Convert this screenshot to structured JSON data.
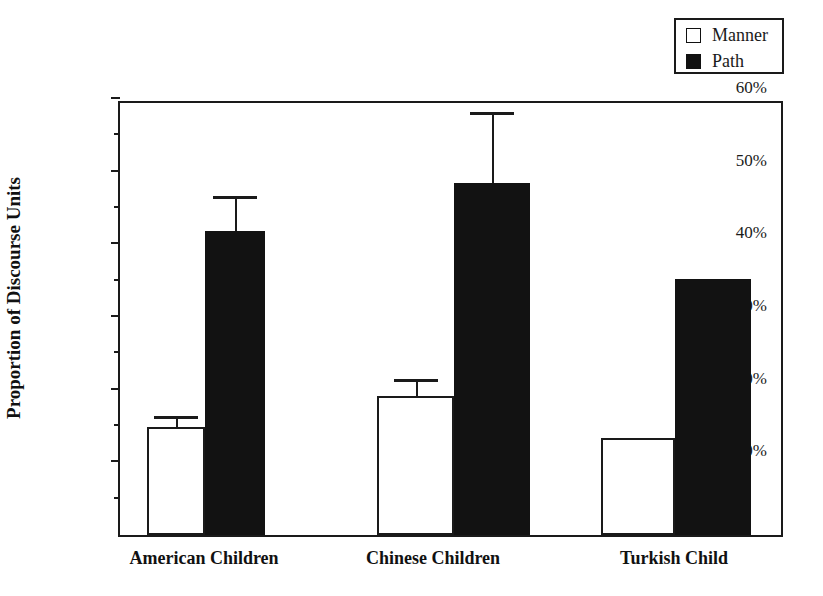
{
  "legend": {
    "position": "top-right",
    "entries": [
      {
        "label": "Manner",
        "swatch": "hollow-square-icon",
        "color": "#ffffff"
      },
      {
        "label": "Path",
        "swatch": "filled-square-icon",
        "color": "#121212"
      }
    ]
  },
  "axes": {
    "ylabel": "Proportion of Discourse Units",
    "ytick_labels": [
      "60%",
      "50%",
      "40%",
      "30%",
      "20%",
      "10%"
    ],
    "ytick_values": [
      60,
      50,
      40,
      30,
      20,
      10
    ],
    "yminor_values": [
      55,
      45,
      35,
      25,
      15,
      5
    ],
    "ylim": [
      0,
      60
    ],
    "xlabel": ""
  },
  "chart_data": {
    "type": "bar",
    "title": "",
    "xlabel": "",
    "ylabel": "Proportion of Discourse Units",
    "ylim": [
      0,
      60
    ],
    "ytick_labels": [
      "10%",
      "20%",
      "30%",
      "40%",
      "50%",
      "60%"
    ],
    "grid": false,
    "legend_position": "top-right",
    "units": "percent",
    "categories": [
      "American Children",
      "Chinese Children",
      "Turkish Child"
    ],
    "series": [
      {
        "name": "Manner",
        "fill": "#ffffff",
        "values": [
          14.8,
          19.1,
          13.3
        ],
        "errors_upper": [
          16.0,
          21.0,
          null
        ]
      },
      {
        "name": "Path",
        "fill": "#121212",
        "values": [
          41.8,
          48.5,
          35.2
        ],
        "errors_upper": [
          46.3,
          57.8,
          null
        ]
      }
    ]
  }
}
